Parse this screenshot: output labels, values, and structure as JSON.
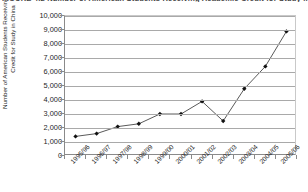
{
  "figure": {
    "caption": "FIGURE 4.2  Number of American Students Receiving Academic Credit for Study in China"
  },
  "chart_data": {
    "type": "line",
    "title": "",
    "xlabel": "",
    "ylabel": "Number of American Students Receiving Academic Credit for Study in China",
    "categories": [
      "1995/96",
      "1996/97",
      "1997/98",
      "1998/99",
      "1999/00",
      "2000/01",
      "2001/02",
      "2002/03",
      "2003/04",
      "2004/05",
      "2005/06"
    ],
    "values": [
      1400,
      1600,
      2100,
      2300,
      3000,
      3000,
      3900,
      2500,
      4800,
      6400,
      8900
    ],
    "ylim": [
      0,
      10000
    ],
    "ytick_values": [
      0,
      1000,
      2000,
      3000,
      4000,
      5000,
      6000,
      7000,
      8000,
      9000,
      10000
    ],
    "ytick_labels": [
      "0",
      "1,000",
      "2,000",
      "3,000",
      "4,000",
      "5,000",
      "6,000",
      "7,000",
      "8,000",
      "9,000",
      "10,000"
    ],
    "grid": true,
    "legend": "none",
    "marker": "diamond",
    "line_color": "#5a5a5a",
    "marker_color": "#111111",
    "grid_color": "#a9a9a9"
  }
}
